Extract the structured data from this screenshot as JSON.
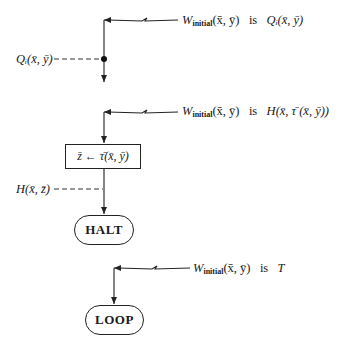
{
  "diagram": {
    "sections": [
      {
        "entry_annotation": {
          "w": "W",
          "sub": "initial",
          "args": "(x̄, ȳ)",
          "is": "is",
          "value": "Qᵢ(x̄, ȳ)"
        },
        "point_label": "Qᵢ(x̄, ȳ)"
      },
      {
        "entry_annotation": {
          "w": "W",
          "sub": "initial",
          "args": "(x̄, ȳ)",
          "is": "is",
          "value": "H(x̄, τ̄ (x̄, ȳ))"
        },
        "assignment_box": "z̄ ← τ̄(x̄, ȳ)",
        "point_label": "H(x̄, z̄)",
        "terminal": "HALT"
      },
      {
        "entry_annotation": {
          "w": "W",
          "sub": "initial",
          "args": "(x̄, ȳ)",
          "is": "is",
          "value": "T"
        },
        "terminal": "LOOP"
      }
    ]
  }
}
